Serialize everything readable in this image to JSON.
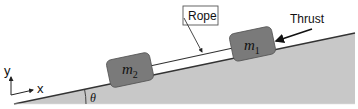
{
  "diagram": {
    "rope_label": "Rope",
    "thrust_label": "Thrust",
    "mass1_label": "m",
    "mass1_sub": "1",
    "mass2_label": "m",
    "mass2_sub": "2",
    "angle_label": "θ",
    "axis_x_label": "x",
    "axis_y_label": "y",
    "colors": {
      "incline_fill": "#c8c8c8",
      "block_fill": "#7a7a7a",
      "line": "#333333"
    }
  }
}
